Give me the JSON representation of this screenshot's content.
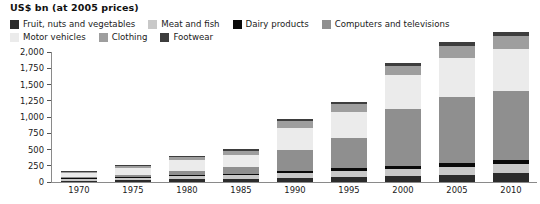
{
  "chart": {
    "units_title": "US$ bn (at 2005 prices)"
  },
  "legend": {
    "rows": [
      [
        {
          "label": "Fruit, nuts and vegetables",
          "color": "#2b2b2b",
          "key": "fruit-nuts-vegetables"
        },
        {
          "label": "Meat and fish",
          "color": "#c8c8c8",
          "key": "meat-and-fish"
        },
        {
          "label": "Dairy products",
          "color": "#0a0a0a",
          "key": "dairy-products"
        },
        {
          "label": "Computers and televisions",
          "color": "#8f8f8f",
          "key": "computers-and-televisions"
        }
      ],
      [
        {
          "label": "Motor vehicles",
          "color": "#ebebeb",
          "key": "motor-vehicles"
        },
        {
          "label": "Clothing",
          "color": "#9e9e9e",
          "key": "clothing"
        },
        {
          "label": "Footwear",
          "color": "#3d3d3d",
          "key": "footwear"
        }
      ]
    ]
  },
  "chart_data": {
    "type": "bar",
    "subtype": "stacked",
    "title": "US$ bn (at 2005 prices)",
    "xlabel": "",
    "ylabel": "US$ bn (at 2005 prices)",
    "ylim": [
      0,
      2000
    ],
    "yticks": [
      0,
      250,
      500,
      750,
      1000,
      1250,
      1500,
      1750,
      2000
    ],
    "ytick_labels": [
      "0",
      "250",
      "500",
      "750",
      "1,000",
      "1,250",
      "1,500",
      "1,750",
      "2,000"
    ],
    "grid": false,
    "legend_position": "top",
    "categories": [
      "1970",
      "1975",
      "1980",
      "1985",
      "1990",
      "1995",
      "2000",
      "2005",
      "2010"
    ],
    "series": [
      {
        "name": "Fruit, nuts and vegetables",
        "color": "#2b2b2b",
        "values": [
          22,
          30,
          42,
          48,
          62,
          78,
          92,
          112,
          132
        ]
      },
      {
        "name": "Meat and fish",
        "color": "#c8c8c8",
        "values": [
          26,
          36,
          50,
          56,
          74,
          92,
          104,
          126,
          148
        ]
      },
      {
        "name": "Dairy products",
        "color": "#0a0a0a",
        "values": [
          12,
          16,
          22,
          24,
          32,
          38,
          44,
          54,
          64
        ]
      },
      {
        "name": "Computers and televisions",
        "color": "#8f8f8f",
        "values": [
          14,
          30,
          62,
          96,
          330,
          470,
          880,
          1010,
          1060
        ]
      },
      {
        "name": "Motor vehicles",
        "color": "#ebebeb",
        "values": [
          62,
          108,
          156,
          196,
          340,
          398,
          520,
          612,
          640
        ]
      },
      {
        "name": "Clothing",
        "color": "#9e9e9e",
        "values": [
          20,
          34,
          52,
          64,
          96,
          124,
          152,
          182,
          204
        ]
      },
      {
        "name": "Footwear",
        "color": "#3d3d3d",
        "values": [
          8,
          12,
          18,
          22,
          30,
          38,
          46,
          54,
          62
        ]
      }
    ],
    "totals": [
      164,
      266,
      402,
      506,
      964,
      1238,
      1838,
      2150,
      2310
    ]
  }
}
